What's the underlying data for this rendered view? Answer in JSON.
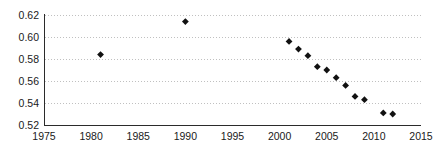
{
  "chart_data": {
    "type": "scatter",
    "title": "",
    "subtitle": "",
    "xlabel": "",
    "ylabel": "",
    "xlim": [
      1975,
      2015
    ],
    "ylim": [
      0.52,
      0.62
    ],
    "grid": true,
    "grid_axis": "y",
    "legend": null,
    "legend_position": "none",
    "marker": "diamond",
    "marker_color": "#111111",
    "xticks": [
      1975,
      1980,
      1985,
      1990,
      1995,
      2000,
      2005,
      2010,
      2015
    ],
    "xtick_labels": [
      "1975",
      "1980",
      "1985",
      "1990",
      "1995",
      "2000",
      "2005",
      "2010",
      "2015"
    ],
    "yticks": [
      0.52,
      0.54,
      0.56,
      0.58,
      0.6,
      0.62
    ],
    "ytick_labels": [
      "0.52",
      "0.54",
      "0.56",
      "0.58",
      "0.60",
      "0.62"
    ],
    "series": [
      {
        "name": "series-1",
        "color": "#111111",
        "points": [
          {
            "x": 1981,
            "y": 0.584
          },
          {
            "x": 1990,
            "y": 0.614
          },
          {
            "x": 2001,
            "y": 0.596
          },
          {
            "x": 2002,
            "y": 0.589
          },
          {
            "x": 2003,
            "y": 0.583
          },
          {
            "x": 2004,
            "y": 0.573
          },
          {
            "x": 2005,
            "y": 0.57
          },
          {
            "x": 2006,
            "y": 0.563
          },
          {
            "x": 2007,
            "y": 0.556
          },
          {
            "x": 2008,
            "y": 0.546
          },
          {
            "x": 2009,
            "y": 0.543
          },
          {
            "x": 2011,
            "y": 0.531
          },
          {
            "x": 2012,
            "y": 0.53
          }
        ]
      }
    ]
  },
  "axes": {
    "y_axis_name": "y-axis",
    "x_axis_name": "x-axis"
  }
}
